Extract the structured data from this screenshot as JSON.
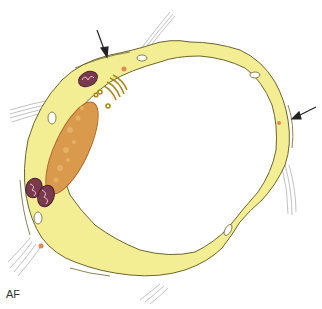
{
  "figure": {
    "label": "AF",
    "colors": {
      "cytoplasm": "#f3ee93",
      "outline": "#6b6530",
      "nucleus": "#d99a4e",
      "mitochondria": "#7a3a4e",
      "golgi": "#a88a1e",
      "vesicle": "#e0885a",
      "fibrils": "#9a9a9a",
      "arrow": "#222222"
    },
    "arrows": [
      {
        "name": "top-arrow",
        "x1": 97,
        "y1": 30,
        "x2": 107,
        "y2": 56
      },
      {
        "name": "right-arrow",
        "x1": 316,
        "y1": 107,
        "x2": 293,
        "y2": 119
      }
    ]
  }
}
